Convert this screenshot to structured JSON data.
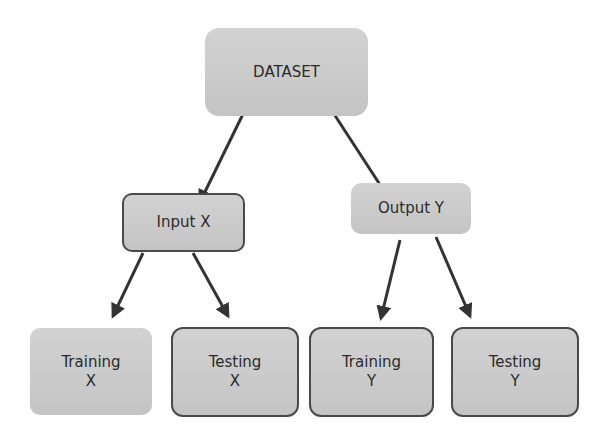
{
  "diagram": {
    "nodes": {
      "dataset": {
        "lines": [
          "DATASET"
        ]
      },
      "input_x": {
        "lines": [
          "Input X"
        ]
      },
      "output_y": {
        "lines": [
          "Output Y"
        ]
      },
      "training_x": {
        "lines": [
          "Training",
          "X"
        ]
      },
      "testing_x": {
        "lines": [
          "Testing",
          "X"
        ]
      },
      "training_y": {
        "lines": [
          "Training",
          "Y"
        ]
      },
      "testing_y": {
        "lines": [
          "Testing",
          "Y"
        ]
      }
    },
    "edges": [
      {
        "from": "dataset",
        "to": "input_x"
      },
      {
        "from": "dataset",
        "to": "output_y"
      },
      {
        "from": "input_x",
        "to": "training_x"
      },
      {
        "from": "input_x",
        "to": "testing_x"
      },
      {
        "from": "output_y",
        "to": "training_y"
      },
      {
        "from": "output_y",
        "to": "testing_y"
      }
    ],
    "colors": {
      "node_fill": "#cccccc",
      "node_border": "#4a4a4a",
      "arrow": "#333333",
      "text": "#2a2a2a"
    }
  }
}
